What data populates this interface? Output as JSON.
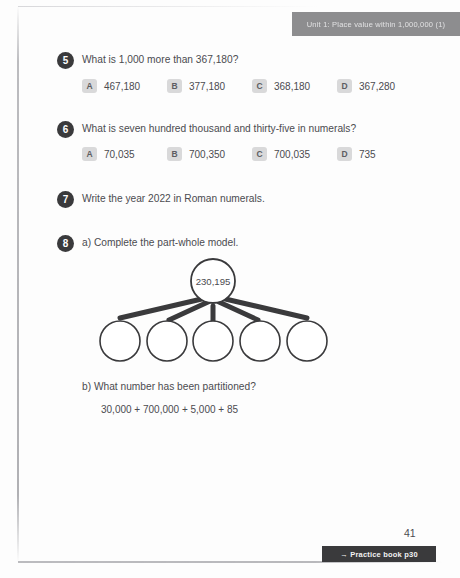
{
  "header": {
    "unit_banner": "Unit 1: Place value within 1,000,000 (1)",
    "banner_color": "#8d8d8f"
  },
  "questions": [
    {
      "number": "5",
      "prompt": "What is 1,000 more than 367,180?",
      "options": [
        {
          "letter": "A",
          "value": "467,180"
        },
        {
          "letter": "B",
          "value": "377,180"
        },
        {
          "letter": "C",
          "value": "368,180"
        },
        {
          "letter": "D",
          "value": "367,280"
        }
      ]
    },
    {
      "number": "6",
      "prompt": "What is seven hundred thousand and thirty-five in numerals?",
      "options": [
        {
          "letter": "A",
          "value": "70,035"
        },
        {
          "letter": "B",
          "value": "700,350"
        },
        {
          "letter": "C",
          "value": "700,035"
        },
        {
          "letter": "D",
          "value": "735"
        }
      ]
    },
    {
      "number": "7",
      "prompt": "Write the year 2022 in Roman numerals."
    },
    {
      "number": "8",
      "part_a_label": "a)  Complete the part-whole model.",
      "part_b_label": "b)  What number has been partitioned?",
      "part_b_expression": "30,000 + 700,000 + 5,000 + 85"
    }
  ],
  "part_whole_model": {
    "whole_value": "230,195",
    "parts_count": 5,
    "parts": [
      "",
      "",
      "",
      "",
      ""
    ],
    "stroke_color": "#3a3a3c"
  },
  "footer": {
    "page_number": "41",
    "practice_book_label": "→ Practice book p30",
    "chip_color": "#3a3a3c"
  }
}
